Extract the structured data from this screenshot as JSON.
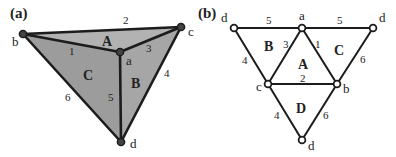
{
  "panels": [
    {
      "id": "a",
      "label": "(a)",
      "description": "Tetrahedron drawn in 3D perspective with shaded faces",
      "vertices": {
        "a": "a",
        "b": "b",
        "c": "c",
        "d": "d"
      },
      "edges": {
        "ab": "1",
        "bc": "2",
        "ac": "3",
        "cd": "4",
        "ad": "5",
        "bd": "6"
      },
      "faces": {
        "A": "A",
        "B": "B",
        "C": "C"
      }
    },
    {
      "id": "b",
      "label": "(b)",
      "description": "Unfolded net of the tetrahedron",
      "vertices": {
        "d_left": "d",
        "a": "a",
        "d_right": "d",
        "c": "c",
        "b": "b",
        "d_bottom": "d"
      },
      "edges": {
        "d_left_a": "5",
        "a_d_right": "5",
        "d_left_c": "4",
        "a_c": "3",
        "a_b": "1",
        "d_right_b": "6",
        "c_b": "2",
        "c_d_bottom": "4",
        "b_d_bottom": "6"
      },
      "faces": {
        "A": "A",
        "B": "B",
        "C": "C",
        "D": "D"
      }
    }
  ],
  "colors": {
    "face_fill": "#9a9a9a",
    "face_fill_light": "#b0b0b0",
    "edge": "#1c1c1c",
    "vertex_fill_a": "#444444",
    "vertex_fill_b": "#ffffff"
  }
}
